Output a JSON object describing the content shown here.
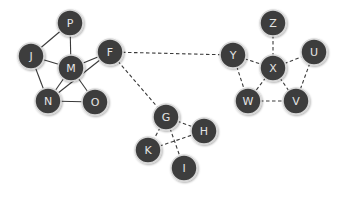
{
  "diagram": {
    "node_radius": 13,
    "node_fill": "#3d3d3d",
    "node_border": "#d8d8d8",
    "label_color": "#e4e4e4",
    "edge_color": "#3a3a3a",
    "nodes": [
      {
        "id": "P",
        "label": "P",
        "x": 70,
        "y": 23
      },
      {
        "id": "J",
        "label": "J",
        "x": 31,
        "y": 56
      },
      {
        "id": "M",
        "label": "M",
        "x": 71,
        "y": 68
      },
      {
        "id": "F",
        "label": "F",
        "x": 110,
        "y": 52
      },
      {
        "id": "N",
        "label": "N",
        "x": 48,
        "y": 101
      },
      {
        "id": "O",
        "label": "O",
        "x": 95,
        "y": 102
      },
      {
        "id": "Z",
        "label": "Z",
        "x": 273,
        "y": 23
      },
      {
        "id": "Y",
        "label": "Y",
        "x": 233,
        "y": 55
      },
      {
        "id": "X",
        "label": "X",
        "x": 273,
        "y": 68
      },
      {
        "id": "U",
        "label": "U",
        "x": 314,
        "y": 52
      },
      {
        "id": "W",
        "label": "W",
        "x": 248,
        "y": 101
      },
      {
        "id": "V",
        "label": "V",
        "x": 296,
        "y": 101
      },
      {
        "id": "G",
        "label": "G",
        "x": 166,
        "y": 117
      },
      {
        "id": "H",
        "label": "H",
        "x": 204,
        "y": 131
      },
      {
        "id": "K",
        "label": "K",
        "x": 148,
        "y": 150
      },
      {
        "id": "I",
        "label": "I",
        "x": 184,
        "y": 168
      }
    ],
    "edges": [
      {
        "from": "P",
        "to": "J",
        "style": "solid"
      },
      {
        "from": "P",
        "to": "M",
        "style": "solid"
      },
      {
        "from": "J",
        "to": "M",
        "style": "solid"
      },
      {
        "from": "J",
        "to": "N",
        "style": "solid"
      },
      {
        "from": "M",
        "to": "F",
        "style": "solid"
      },
      {
        "from": "M",
        "to": "N",
        "style": "solid"
      },
      {
        "from": "M",
        "to": "O",
        "style": "solid"
      },
      {
        "from": "N",
        "to": "O",
        "style": "solid"
      },
      {
        "from": "F",
        "to": "N",
        "style": "solid"
      },
      {
        "from": "F",
        "to": "Y",
        "style": "dashed"
      },
      {
        "from": "F",
        "to": "G",
        "style": "dashed"
      },
      {
        "from": "Z",
        "to": "X",
        "style": "dashed"
      },
      {
        "from": "Y",
        "to": "X",
        "style": "dashed"
      },
      {
        "from": "X",
        "to": "U",
        "style": "dashed"
      },
      {
        "from": "Y",
        "to": "W",
        "style": "dashed"
      },
      {
        "from": "U",
        "to": "V",
        "style": "dashed"
      },
      {
        "from": "W",
        "to": "V",
        "style": "dashed"
      },
      {
        "from": "X",
        "to": "W",
        "style": "dashed"
      },
      {
        "from": "X",
        "to": "V",
        "style": "dashed"
      },
      {
        "from": "G",
        "to": "H",
        "style": "dashed"
      },
      {
        "from": "G",
        "to": "K",
        "style": "dashed"
      },
      {
        "from": "G",
        "to": "I",
        "style": "dashed"
      },
      {
        "from": "K",
        "to": "H",
        "style": "dashed"
      }
    ]
  }
}
